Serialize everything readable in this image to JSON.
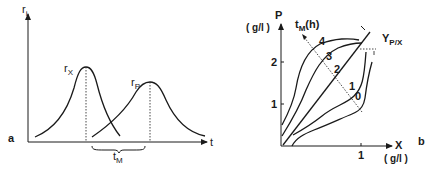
{
  "figure": {
    "panel_a": {
      "letter": "a",
      "y_axis_label": {
        "main": "r",
        "sub": "i"
      },
      "x_axis_label": "t",
      "curves": [
        {
          "name": "r_X",
          "label_main": "r",
          "label_sub": "X",
          "peak_x_px": 86,
          "peak_y_px": 67
        },
        {
          "name": "r_P",
          "label_main": "r",
          "label_sub": "P",
          "peak_x_px": 150,
          "peak_y_px": 82
        }
      ],
      "interval_label": {
        "main": "t",
        "sub": "M"
      }
    },
    "panel_b": {
      "letter": "b",
      "y_axis_label": "P",
      "y_axis_unit": "( g/l )",
      "x_axis_label": "X",
      "x_axis_unit": "( g/l )",
      "y_ticks": [
        "1",
        "2"
      ],
      "x_ticks": [
        "1"
      ],
      "direction_label": {
        "main": "t",
        "sub": "M",
        "suffix": "(h)"
      },
      "yield_label": {
        "main": "Y",
        "sub": "P/X"
      },
      "curve_labels": [
        "4",
        "3",
        "2",
        "1",
        "0"
      ]
    }
  }
}
